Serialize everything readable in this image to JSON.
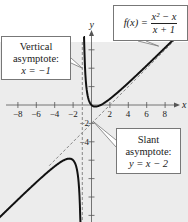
{
  "chart_data": {
    "type": "line",
    "title": "",
    "xlabel": "x",
    "ylabel": "y",
    "xlim": [
      -10,
      10.3
    ],
    "ylim": [
      -12.5,
      6.8
    ],
    "x_ticks": [
      -8,
      -6,
      -4,
      -2,
      2,
      4,
      6,
      8
    ],
    "x_tick_labels": [
      "−8",
      "−6",
      "−4",
      "−2",
      "2",
      "4",
      "6",
      "8"
    ],
    "y_ticks": [
      -12,
      -10,
      -8,
      -6,
      -4,
      -2,
      2,
      4,
      6
    ],
    "y_tick_labels": [
      "−2",
      "−4"
    ],
    "y_labeled_ticks": [
      -2,
      -4
    ],
    "grid": false,
    "background_color": "#ececec",
    "series": [
      {
        "name": "f(x) = (x^2 - x)/(x + 1)",
        "function": "(x*x - x)/(x + 1)",
        "style": "solid",
        "color": "#111111",
        "branches": [
          [
            -10,
            -1.04
          ],
          [
            -0.86,
            8.9
          ]
        ]
      },
      {
        "name": "Slant asymptote: y = x - 2",
        "function": "x - 2",
        "style": "dashed",
        "color": "#888888"
      },
      {
        "name": "Vertical asymptote: x = -1",
        "x": -1,
        "style": "dashed",
        "color": "#888888"
      }
    ],
    "annotations": [
      {
        "id": "function-label",
        "prefix": "f(x) =",
        "numerator": "x² − x",
        "denominator": "x + 1",
        "points_to": [
          7.3,
          6.4
        ]
      },
      {
        "id": "vertical-asymptote-label",
        "lines": [
          "Vertical",
          "asymptote:",
          "x = −1"
        ],
        "points_to": [
          -1,
          4
        ]
      },
      {
        "id": "slant-asymptote-label",
        "lines": [
          "Slant",
          "asymptote:",
          "y = x − 2"
        ],
        "points_to": [
          0.2,
          -1.8
        ]
      }
    ]
  }
}
